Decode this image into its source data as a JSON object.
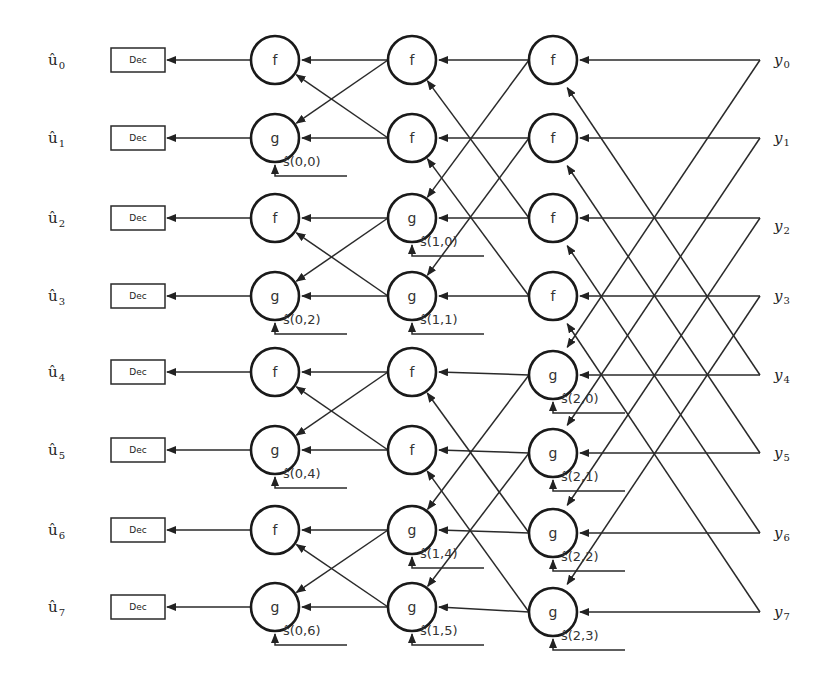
{
  "diagram": {
    "outputs": [
      {
        "base": "û",
        "sub": "0"
      },
      {
        "base": "û",
        "sub": "1"
      },
      {
        "base": "û",
        "sub": "2"
      },
      {
        "base": "û",
        "sub": "3"
      },
      {
        "base": "û",
        "sub": "4"
      },
      {
        "base": "û",
        "sub": "5"
      },
      {
        "base": "û",
        "sub": "6"
      },
      {
        "base": "û",
        "sub": "7"
      }
    ],
    "decision_label": "Dec",
    "inputs": [
      {
        "base": "y",
        "sub": "0"
      },
      {
        "base": "y",
        "sub": "1"
      },
      {
        "base": "y",
        "sub": "2"
      },
      {
        "base": "y",
        "sub": "3"
      },
      {
        "base": "y",
        "sub": "4"
      },
      {
        "base": "y",
        "sub": "5"
      },
      {
        "base": "y",
        "sub": "6"
      },
      {
        "base": "y",
        "sub": "7"
      }
    ],
    "stages": [
      {
        "nodes": [
          "f",
          "g",
          "f",
          "g",
          "f",
          "g",
          "f",
          "g"
        ]
      },
      {
        "nodes": [
          "f",
          "f",
          "g",
          "g",
          "f",
          "f",
          "g",
          "g"
        ]
      },
      {
        "nodes": [
          "f",
          "f",
          "f",
          "f",
          "g",
          "g",
          "g",
          "g"
        ]
      }
    ],
    "partial_sums": [
      {
        "stage": 0,
        "row": 1,
        "label": "ŝ(0,0)"
      },
      {
        "stage": 0,
        "row": 3,
        "label": "ŝ(0,2)"
      },
      {
        "stage": 0,
        "row": 5,
        "label": "ŝ(0,4)"
      },
      {
        "stage": 0,
        "row": 7,
        "label": "ŝ(0,6)"
      },
      {
        "stage": 1,
        "row": 2,
        "label": "ŝ(1,0)"
      },
      {
        "stage": 1,
        "row": 3,
        "label": "ŝ(1,1)"
      },
      {
        "stage": 1,
        "row": 6,
        "label": "ŝ(1,4)"
      },
      {
        "stage": 1,
        "row": 7,
        "label": "ŝ(1,5)"
      },
      {
        "stage": 2,
        "row": 4,
        "label": "ŝ(2,0)"
      },
      {
        "stage": 2,
        "row": 5,
        "label": "ŝ(2,1)"
      },
      {
        "stage": 2,
        "row": 6,
        "label": "ŝ(2,2)"
      },
      {
        "stage": 2,
        "row": 7,
        "label": "ŝ(2,3)"
      }
    ]
  }
}
